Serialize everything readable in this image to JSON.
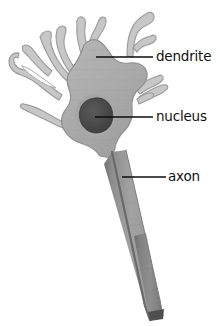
{
  "figure": {
    "background_color": "#ffffff",
    "palette": {
      "soma_fill": "#a9a9a9",
      "soma_fill_light": "#b4b4b4",
      "soma_outline": "#8f8f8f",
      "dendrite_fill": "#c9c9c9",
      "dendrite_outline": "#9a9a9a",
      "nucleus_fill": "#4a4a4a",
      "nucleus_halo": "#8c8c8c",
      "axon_fill": "#9e9e9e",
      "axon_edge_dark": "#6e6e6e",
      "axon_tip": "#555555",
      "leader_line": "#0d0d0d",
      "label_color": "#111111"
    }
  },
  "labels": [
    {
      "id": "dendrite",
      "text": "dendrite",
      "text_x": 156,
      "text_y": 57,
      "line_x1": 96,
      "line_y1": 57,
      "line_x2": 153,
      "line_y2": 57
    },
    {
      "id": "nucleus",
      "text": "nucleus",
      "text_x": 156,
      "text_y": 117,
      "line_x1": 95,
      "line_y1": 117,
      "line_x2": 153,
      "line_y2": 117
    },
    {
      "id": "axon",
      "text": "axon",
      "text_x": 168,
      "text_y": 177,
      "line_x1": 122,
      "line_y1": 177,
      "line_x2": 166,
      "line_y2": 177
    }
  ],
  "parts": {
    "soma_label": "cell body (soma)",
    "nucleus_label": "nucleus",
    "axon_label": "axon",
    "dendrites_label": "dendrites"
  }
}
